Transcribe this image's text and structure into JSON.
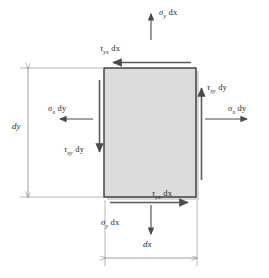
{
  "diagram": {
    "type": "stress-element",
    "colors": {
      "element_fill": "#d9d9d9",
      "element_stroke": "#3a3a3a",
      "arrow": "#4a4a4a",
      "dimension_line": "#8a8a8a",
      "text": "#2b2b2b",
      "background": "#ffffff"
    },
    "element": {
      "x": 104,
      "y": 68,
      "width": 92,
      "height": 129,
      "shadow_offset": 3
    },
    "labels": {
      "sigma_y_top": {
        "greek": "σ",
        "sub": "y",
        "rest": " dx",
        "x": 159,
        "y": 11
      },
      "tau_yx_top": {
        "greek": "τ",
        "sub": "yx",
        "rest": " dx",
        "x": 100,
        "y": 47
      },
      "tau_xy_right": {
        "greek": "τ",
        "sub": "xy",
        "rest": " dy",
        "x": 199,
        "y": 86
      },
      "sigma_x_right": {
        "greek": "σ",
        "sub": "x",
        "rest": " dy",
        "x": 226,
        "y": 107
      },
      "sigma_x_left": {
        "greek": "σ",
        "sub": "x",
        "rest": " dy",
        "x": 48,
        "y": 107
      },
      "tau_xy_left": {
        "greek": "τ",
        "sub": "xy",
        "rest": " dy",
        "x": 66,
        "y": 148
      },
      "tau_yx_bottom": {
        "greek": "τ",
        "sub": "yx",
        "rest": " dx",
        "x": 151,
        "y": 191
      },
      "sigma_y_bottom": {
        "greek": "σ",
        "sub": "y",
        "rest": " dx",
        "x": 101,
        "y": 220
      }
    },
    "dimensions": {
      "dy": {
        "label": "dy",
        "x": 14,
        "y": 126,
        "line_x": 28,
        "y1": 68,
        "y2": 197
      },
      "dx": {
        "label": "dx",
        "x": 144,
        "y": 243,
        "line_y": 258,
        "x1": 105,
        "x2": 197
      }
    },
    "arrows": {
      "sigma_y_top": {
        "x1": 151,
        "y1": 38,
        "x2": 151,
        "y2": 15,
        "direction": "up"
      },
      "sigma_y_bottom": {
        "x1": 151,
        "y1": 205,
        "x2": 151,
        "y2": 233,
        "direction": "down"
      },
      "sigma_x_left": {
        "x1": 92,
        "y1": 119,
        "x2": 62,
        "y2": 119,
        "direction": "left"
      },
      "sigma_x_right": {
        "x1": 206,
        "y1": 119,
        "x2": 245,
        "y2": 119,
        "direction": "right"
      },
      "tau_yx_top": {
        "x1": 190,
        "y1": 62,
        "x2": 112,
        "y2": 62,
        "direction": "left"
      },
      "tau_yx_bottom": {
        "x1": 110,
        "y1": 202,
        "x2": 190,
        "y2": 202,
        "direction": "right"
      },
      "tau_xy_left": {
        "x1": 100,
        "y1": 80,
        "x2": 100,
        "y2": 155,
        "direction": "down"
      },
      "tau_xy_right": {
        "x1": 201,
        "y1": 180,
        "x2": 201,
        "y2": 90,
        "direction": "up"
      }
    }
  }
}
